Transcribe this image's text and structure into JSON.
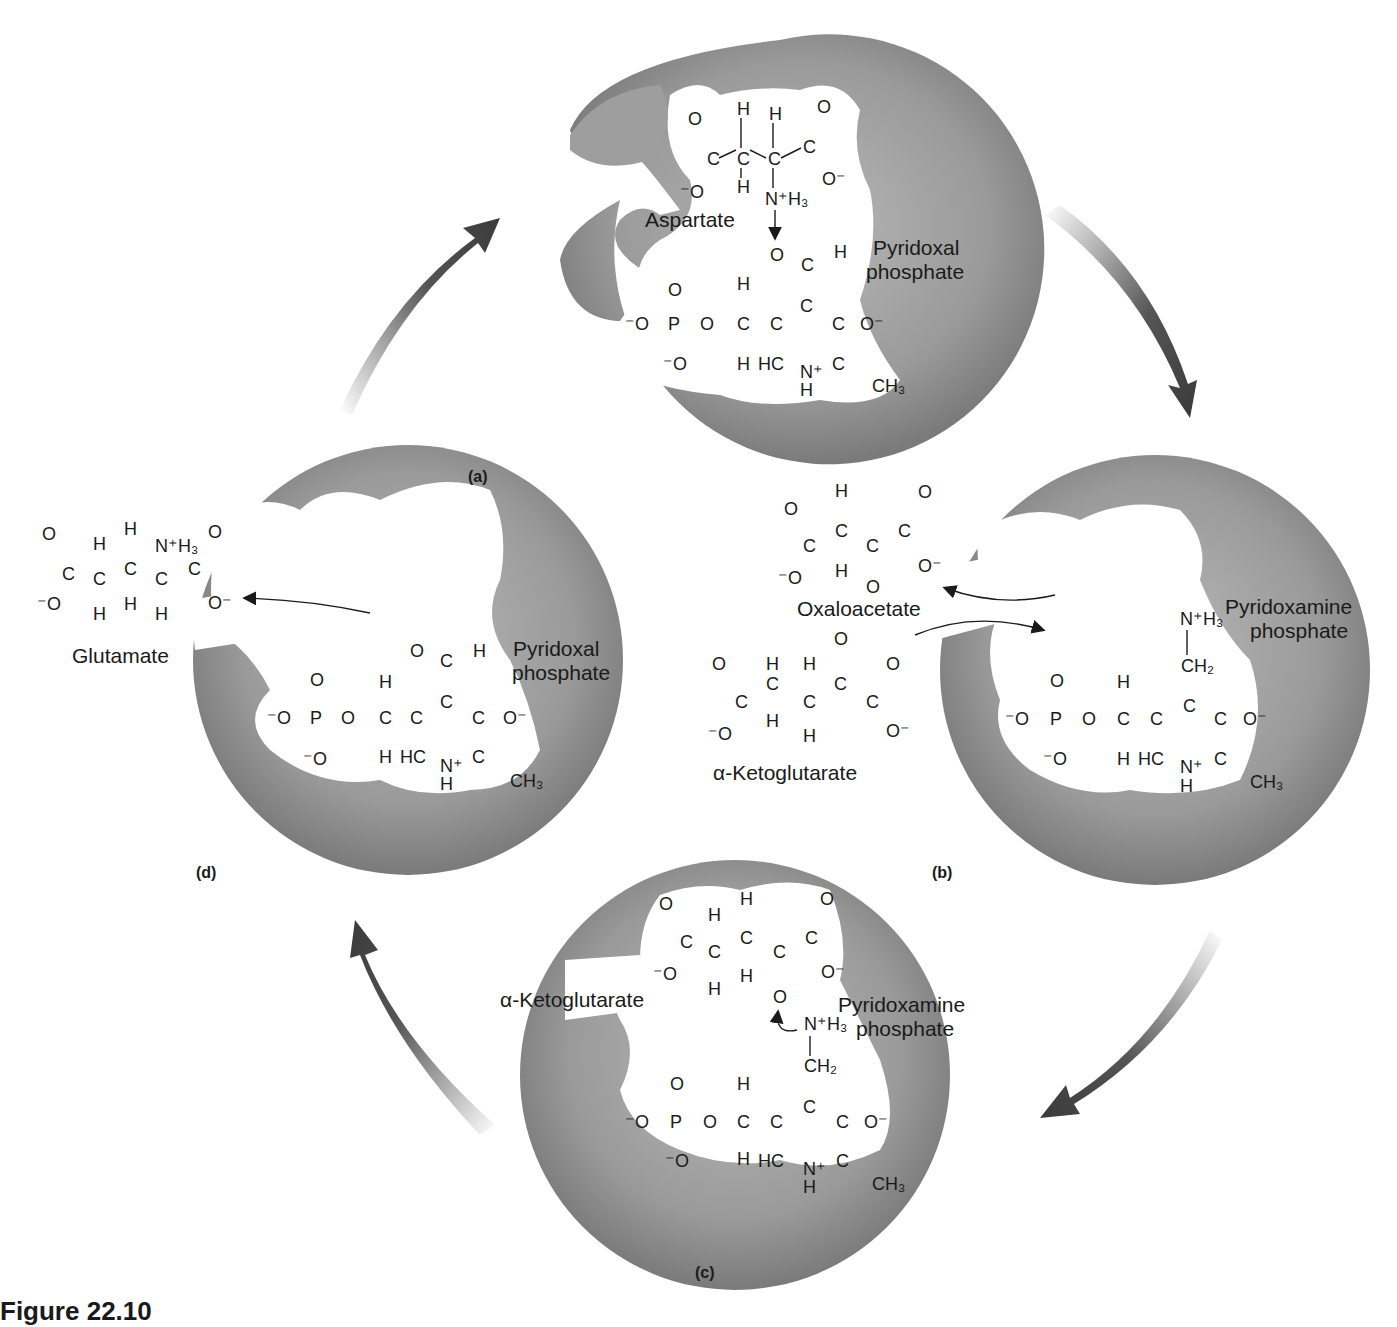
{
  "figure": {
    "caption": "Figure 22.10",
    "colors": {
      "enzyme_gray": "#8c8c8c",
      "enzyme_light": "#b5b5b5",
      "arrow_dark": "#3a3a3a",
      "text": "#1a1a1a"
    }
  },
  "panels": {
    "a": {
      "label": "(a)",
      "substrate": "Aspartate",
      "cofactor_line1": "Pyridoxal",
      "cofactor_line2": "phosphate"
    },
    "b": {
      "label": "(b)",
      "released_product": "Oxaloacetate",
      "entering_substrate": "α-Ketoglutarate",
      "cofactor_line1": "Pyridoxamine",
      "cofactor_line2": "phosphate"
    },
    "c": {
      "label": "(c)",
      "substrate": "α-Ketoglutarate",
      "cofactor_line1": "Pyridoxamine",
      "cofactor_line2": "phosphate"
    },
    "d": {
      "label": "(d)",
      "released_product": "Glutamate",
      "cofactor_line1": "Pyridoxal",
      "cofactor_line2": "phosphate"
    }
  },
  "atoms": {
    "O": "O",
    "C": "C",
    "H": "H",
    "P": "P",
    "N": "N",
    "HC": "HC",
    "Ominus": "O⁻",
    "minusO": "⁻O",
    "NH3": "N⁺H₃",
    "CH3": "CH₃",
    "CH2": "CH₂",
    "Nplus": "N⁺"
  },
  "cycle_arrows": [
    "d-to-a",
    "a-to-b",
    "b-to-c",
    "c-to-d"
  ]
}
